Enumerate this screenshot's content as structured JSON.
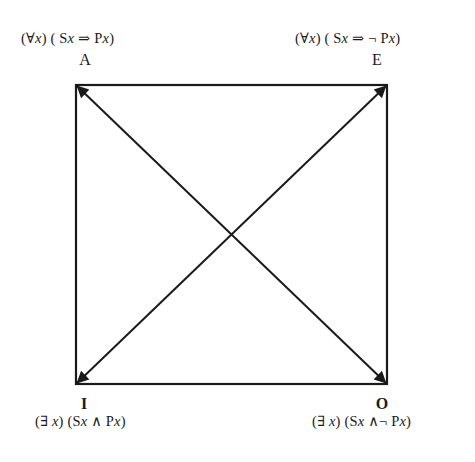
{
  "diagram": {
    "corners": {
      "A": {
        "letter": "A",
        "formula": "(∀x) ( Sx ⇒ Px)",
        "formula_parts": [
          "(∀",
          "x",
          ") ( S",
          "x",
          " ⇒  P",
          "x",
          ")"
        ]
      },
      "E": {
        "letter": "E",
        "formula": "(∀x) ( Sx ⇒ ¬ Px)",
        "formula_parts": [
          "(∀",
          "x",
          ") ( S",
          "x",
          " ⇒ ¬ P",
          "x",
          ")"
        ]
      },
      "I": {
        "letter": "I",
        "formula": "(∃ x) (Sx ∧ Px)",
        "formula_parts": [
          "(∃ ",
          "x",
          ") (S",
          "x",
          " ∧ P",
          "x",
          ")"
        ]
      },
      "O": {
        "letter": "O",
        "formula": "(∃ x) (Sx ∧¬ Px)",
        "formula_parts": [
          "(∃ ",
          "x",
          ") (S",
          "x",
          " ∧¬ P",
          "x",
          ")"
        ]
      }
    },
    "geometry": {
      "square": {
        "x1": 76,
        "y1": 85,
        "x2": 387,
        "y2": 384
      },
      "line_color": "#1a1a1a",
      "arrows": [
        {
          "from": "A",
          "to": "O",
          "bidirectional": true
        },
        {
          "from": "E",
          "to": "I",
          "bidirectional": true
        }
      ]
    }
  }
}
